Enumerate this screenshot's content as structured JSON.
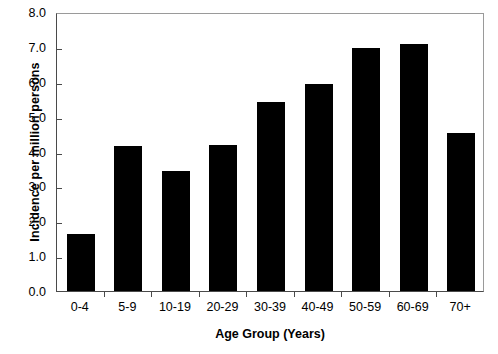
{
  "chart_data": {
    "type": "bar",
    "title": "",
    "subtitle": "",
    "xlabel": "Age Group (Years)",
    "ylabel": "Incidence per million persons",
    "categories": [
      "0-4",
      "5-9",
      "10-19",
      "20-29",
      "30-39",
      "40-49",
      "50-59",
      "60-69",
      "70+"
    ],
    "values": [
      1.64,
      4.17,
      3.45,
      4.18,
      5.42,
      5.95,
      6.97,
      7.08,
      4.53
    ],
    "ylim": [
      0.0,
      8.0
    ],
    "ytick_step": 1.0,
    "ytick_labels": [
      "0.0",
      "1.0",
      "2.0",
      "3.0",
      "4.0",
      "5.0",
      "6.0",
      "7.0",
      "8.0"
    ],
    "ytick_values": [
      0.0,
      1.0,
      2.0,
      3.0,
      4.0,
      5.0,
      6.0,
      7.0,
      8.0
    ],
    "grid": false,
    "legend": null,
    "legend_position": "none",
    "bar_color": "#000000",
    "axis_color": "#4a4a4a",
    "frame_color": "#9a9a9a",
    "background_color": "#ffffff"
  }
}
